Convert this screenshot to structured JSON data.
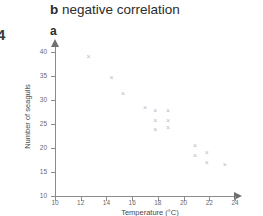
{
  "header": {
    "edge_glyph": "4",
    "title_lead": "b",
    "title_text": " negative correlation",
    "sublabel": "a"
  },
  "chart_data": {
    "type": "scatter",
    "title": "negative correlation",
    "xlabel": "Temperature (°C)",
    "ylabel": "Number of seagulls",
    "xlim": [
      10,
      24
    ],
    "ylim": [
      10,
      40
    ],
    "xticks": [
      10,
      12,
      14,
      16,
      18,
      20,
      22,
      24
    ],
    "yticks": [
      10,
      15,
      20,
      25,
      30,
      35,
      40
    ],
    "grid": false,
    "legend": false,
    "marker": "x",
    "marker_color": "#b9b9b9",
    "axis_color": "#8c8c8c",
    "points": [
      {
        "x": 12.6,
        "y": 39.0
      },
      {
        "x": 14.4,
        "y": 34.7
      },
      {
        "x": 15.3,
        "y": 31.4
      },
      {
        "x": 17.0,
        "y": 28.5
      },
      {
        "x": 17.8,
        "y": 27.8
      },
      {
        "x": 17.8,
        "y": 25.8
      },
      {
        "x": 17.8,
        "y": 23.8
      },
      {
        "x": 18.8,
        "y": 27.8
      },
      {
        "x": 18.8,
        "y": 25.8
      },
      {
        "x": 18.8,
        "y": 24.2
      },
      {
        "x": 20.9,
        "y": 20.5
      },
      {
        "x": 20.9,
        "y": 18.4
      },
      {
        "x": 21.8,
        "y": 19.0
      },
      {
        "x": 21.8,
        "y": 17.0
      },
      {
        "x": 23.2,
        "y": 16.5
      }
    ]
  }
}
